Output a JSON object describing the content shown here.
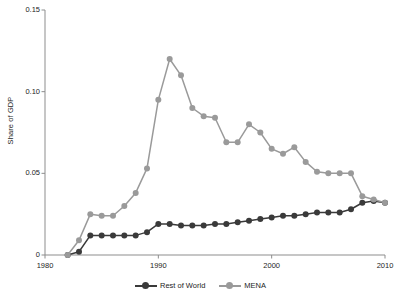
{
  "chart_data": {
    "type": "line",
    "title": "",
    "subtitle": "",
    "xlabel": "",
    "ylabel": "Share of GDP",
    "xlim": [
      1980,
      2010
    ],
    "ylim": [
      0,
      0.15
    ],
    "xticks": [
      "1980",
      "1990",
      "2000",
      "2010"
    ],
    "xtick_values": [
      1980,
      1990,
      2000,
      2010
    ],
    "yticks": [
      "0",
      "0.05",
      "0.10",
      "0.15"
    ],
    "ytick_values": [
      0,
      0.05,
      0.1,
      0.15
    ],
    "grid": false,
    "legend_position": "bottom-center",
    "x": [
      1982,
      1983,
      1984,
      1985,
      1986,
      1987,
      1988,
      1989,
      1990,
      1991,
      1992,
      1993,
      1994,
      1995,
      1996,
      1997,
      1998,
      1999,
      2000,
      2001,
      2002,
      2003,
      2004,
      2005,
      2006,
      2007,
      2008,
      2009,
      2010
    ],
    "series": [
      {
        "name": "Rest of World",
        "color": "#3a3a3a",
        "marker": "circle",
        "values": [
          0.0,
          0.002,
          0.012,
          0.012,
          0.012,
          0.012,
          0.012,
          0.014,
          0.019,
          0.019,
          0.018,
          0.018,
          0.018,
          0.019,
          0.019,
          0.02,
          0.021,
          0.022,
          0.023,
          0.024,
          0.024,
          0.025,
          0.026,
          0.026,
          0.026,
          0.028,
          0.032,
          0.033,
          0.032
        ]
      },
      {
        "name": "MENA",
        "color": "#9a9a9a",
        "marker": "circle",
        "values": [
          0.0,
          0.009,
          0.025,
          0.024,
          0.024,
          0.03,
          0.038,
          0.053,
          0.095,
          0.12,
          0.11,
          0.09,
          0.085,
          0.084,
          0.069,
          0.069,
          0.08,
          0.075,
          0.065,
          0.062,
          0.066,
          0.057,
          0.051,
          0.05,
          0.05,
          0.05,
          0.036,
          0.034,
          0.032
        ]
      }
    ]
  },
  "legend": {
    "items": [
      {
        "label": "Rest of World",
        "color": "#3a3a3a"
      },
      {
        "label": "MENA",
        "color": "#9a9a9a"
      }
    ]
  },
  "axes": {
    "y_axis_title": "Share of GDP",
    "axis_color": "#8d8d8d"
  }
}
